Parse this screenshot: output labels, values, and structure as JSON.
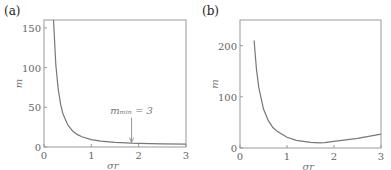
{
  "panels": {
    "a": {
      "label": "(a)"
    },
    "b": {
      "label": "(b)"
    }
  },
  "chart_data": [
    {
      "type": "line",
      "panel": "(a)",
      "xlabel": "σr",
      "ylabel": "m",
      "xlim": [
        0,
        3
      ],
      "ylim": [
        0,
        160
      ],
      "xticks": [
        "0",
        "1",
        "2",
        "3"
      ],
      "yticks": [
        "0",
        "50",
        "100",
        "150"
      ],
      "grid": false,
      "annotation": {
        "text": "m_min = 3",
        "x": 1.85,
        "y": 3
      },
      "series": [
        {
          "name": "m",
          "x": [
            0.2,
            0.25,
            0.3,
            0.35,
            0.4,
            0.5,
            0.6,
            0.7,
            0.8,
            1.0,
            1.2,
            1.5,
            1.85,
            2.0,
            2.5,
            3.0
          ],
          "y": [
            160,
            104,
            73,
            54,
            42,
            28,
            20.5,
            15.9,
            12.8,
            9.3,
            7.4,
            5.8,
            4.8,
            4.6,
            4.0,
            3.7
          ]
        }
      ]
    },
    {
      "type": "line",
      "panel": "(b)",
      "xlabel": "σr",
      "ylabel": "m",
      "xlim": [
        0,
        3
      ],
      "ylim": [
        0,
        250
      ],
      "xticks": [
        "0",
        "1",
        "2",
        "3"
      ],
      "yticks": [
        "0",
        "100",
        "200"
      ],
      "grid": false,
      "series": [
        {
          "name": "m",
          "x": [
            0.3,
            0.35,
            0.4,
            0.5,
            0.6,
            0.7,
            0.8,
            1.0,
            1.2,
            1.5,
            1.7,
            1.8,
            2.0,
            2.5,
            3.0
          ],
          "y": [
            210,
            155,
            118,
            76,
            54,
            40,
            32,
            21,
            15,
            11,
            10,
            10.5,
            13,
            19,
            27
          ]
        }
      ]
    }
  ]
}
